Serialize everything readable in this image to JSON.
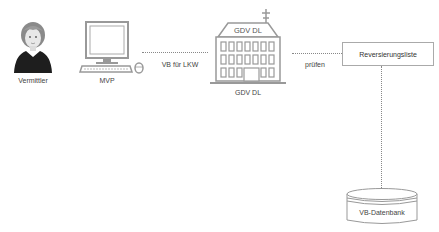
{
  "nodes": {
    "vermittler": {
      "label": "Vermittler",
      "icon": "person-icon"
    },
    "mvp": {
      "label": "MVP",
      "icon": "computer-icon"
    },
    "gdv": {
      "label": "GDV DL",
      "roof_label": "GDV DL",
      "icon": "building-icon"
    },
    "reversierungsliste": {
      "label": "Reversierungsliste"
    },
    "datenbank": {
      "label": "VB-Datenbank",
      "icon": "database-icon"
    }
  },
  "edges": {
    "mvp_to_gdv": {
      "label": "VB für LKW"
    },
    "gdv_to_liste": {
      "label": "prüfen"
    },
    "liste_to_db": {
      "label": ""
    }
  },
  "colors": {
    "line": "#888888",
    "stroke": "#999999",
    "text": "#444444"
  }
}
